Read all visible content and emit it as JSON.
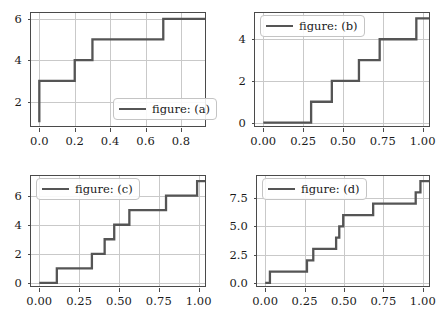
{
  "figure": {
    "width": 444,
    "height": 321,
    "background": "#ffffff",
    "line_color": "#555555",
    "grid_color": "#c9c9c9",
    "axes_color": "#4a4a4a",
    "text_color": "#1a1a1a"
  },
  "chart_data": [
    {
      "id": "a",
      "type": "line",
      "drawstyle": "steps-post",
      "title": "",
      "xlabel": "",
      "ylabel": "",
      "legend": "figure: (a)",
      "legend_position": "lower right",
      "grid": true,
      "xlim": [
        -0.047,
        0.947
      ],
      "ylim": [
        0.72,
        6.28
      ],
      "xticks": [
        0.0,
        0.2,
        0.4,
        0.6,
        0.8
      ],
      "xticklabels": [
        "0.0",
        "0.2",
        "0.4",
        "0.6",
        "0.8"
      ],
      "yticks": [
        2,
        4,
        6
      ],
      "yticklabels": [
        "2",
        "4",
        "6"
      ],
      "x": [
        0.0,
        0.0,
        0.2,
        0.3,
        0.7,
        0.9
      ],
      "y": [
        1.0,
        3.0,
        4.0,
        5.0,
        6.0,
        6.0
      ]
    },
    {
      "id": "b",
      "type": "line",
      "drawstyle": "steps-post",
      "title": "",
      "xlabel": "",
      "ylabel": "",
      "legend": "figure: (b)",
      "legend_position": "upper left",
      "grid": true,
      "xlim": [
        -0.052,
        1.052
      ],
      "ylim": [
        -0.26,
        5.26
      ],
      "xticks": [
        0.0,
        0.25,
        0.5,
        0.75,
        1.0
      ],
      "xticklabels": [
        "0.00",
        "0.25",
        "0.50",
        "0.75",
        "1.00"
      ],
      "yticks": [
        0,
        2,
        4
      ],
      "yticklabels": [
        "0",
        "2",
        "4"
      ],
      "x": [
        0.0,
        0.3,
        0.43,
        0.6,
        0.73,
        0.96,
        1.0
      ],
      "y": [
        0.0,
        1.0,
        2.0,
        3.0,
        4.0,
        5.0,
        5.0
      ]
    },
    {
      "id": "c",
      "type": "line",
      "drawstyle": "steps-post",
      "title": "",
      "xlabel": "",
      "ylabel": "",
      "legend": "figure: (c)",
      "legend_position": "upper left",
      "grid": true,
      "xlim": [
        -0.052,
        1.052
      ],
      "ylim": [
        -0.35,
        7.35
      ],
      "xticks": [
        0.0,
        0.25,
        0.5,
        0.75,
        1.0
      ],
      "xticklabels": [
        "0.00",
        "0.25",
        "0.50",
        "0.75",
        "1.00"
      ],
      "yticks": [
        0,
        2,
        4,
        6
      ],
      "yticklabels": [
        "0",
        "2",
        "4",
        "6"
      ],
      "x": [
        0.0,
        0.11,
        0.33,
        0.41,
        0.47,
        0.565,
        0.795,
        0.99,
        1.0
      ],
      "y": [
        0.0,
        1.0,
        2.0,
        3.0,
        4.0,
        5.0,
        6.0,
        7.0,
        7.0
      ]
    },
    {
      "id": "d",
      "type": "line",
      "drawstyle": "steps-post",
      "title": "",
      "xlabel": "",
      "ylabel": "",
      "legend": "figure: (d)",
      "legend_position": "upper left",
      "grid": true,
      "xlim": [
        -0.052,
        1.052
      ],
      "ylim": [
        -0.45,
        9.45
      ],
      "xticks": [
        0.0,
        0.25,
        0.5,
        0.75,
        1.0
      ],
      "xticklabels": [
        "0.00",
        "0.25",
        "0.50",
        "0.75",
        "1.00"
      ],
      "yticks": [
        0.0,
        2.5,
        5.0,
        7.5
      ],
      "yticklabels": [
        "0.0",
        "2.5",
        "5.0",
        "7.5"
      ],
      "x": [
        0.0,
        0.03,
        0.265,
        0.305,
        0.45,
        0.47,
        0.495,
        0.685,
        0.955,
        0.985,
        1.0
      ],
      "y": [
        0.0,
        1.0,
        2.0,
        3.0,
        4.0,
        5.0,
        6.0,
        7.0,
        8.0,
        9.0,
        9.0
      ]
    }
  ]
}
